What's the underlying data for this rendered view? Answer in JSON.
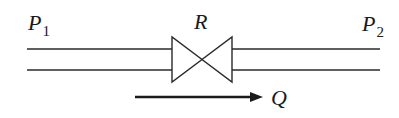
{
  "diagram": {
    "type": "pipe-flow-with-valve",
    "labels": {
      "inlet_pressure": {
        "main": "P",
        "sub": "1"
      },
      "outlet_pressure": {
        "main": "P",
        "sub": "2"
      },
      "resistance": "R",
      "flow": "Q"
    },
    "colors": {
      "stroke": "#2a2a2a",
      "background": "#ffffff"
    },
    "elements": [
      {
        "id": "pipe-left",
        "kind": "double-line pipe",
        "from_x": 27,
        "to_x": 172
      },
      {
        "id": "valve",
        "kind": "bow-tie valve symbol",
        "label": "R"
      },
      {
        "id": "pipe-right",
        "kind": "double-line pipe",
        "from_x": 232,
        "to_x": 380
      },
      {
        "id": "flow-arrow",
        "kind": "arrow",
        "direction": "right",
        "label": "Q"
      }
    ]
  }
}
